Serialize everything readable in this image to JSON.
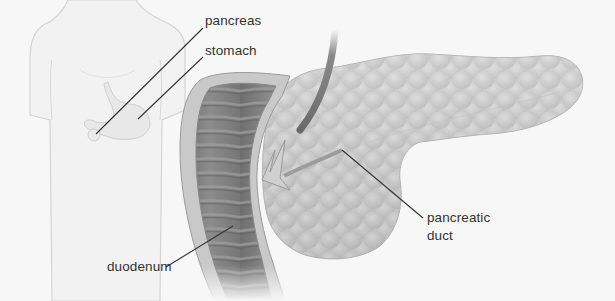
{
  "diagram": {
    "type": "anatomical-illustration",
    "background_color": "#f7f7f7",
    "line_color": "#333333",
    "labels": [
      {
        "id": "pancreas",
        "text": "pancreas",
        "x": 205,
        "y": 13,
        "leader": {
          "x1": 96,
          "y1": 134,
          "x2": 203,
          "y2": 28
        }
      },
      {
        "id": "stomach",
        "text": "stomach",
        "x": 205,
        "y": 43,
        "leader": {
          "x1": 138,
          "y1": 119,
          "x2": 203,
          "y2": 57
        }
      },
      {
        "id": "pancreatic-duct",
        "text": "pancreatic",
        "text2": "duct",
        "x": 427,
        "y": 210,
        "leader": {
          "x1": 342,
          "y1": 150,
          "x2": 423,
          "y2": 218
        }
      },
      {
        "id": "duodenum",
        "text": "duodenum",
        "x": 107,
        "y": 259,
        "leader": {
          "x1": 166,
          "y1": 267,
          "x2": 233,
          "y2": 226
        }
      }
    ]
  }
}
